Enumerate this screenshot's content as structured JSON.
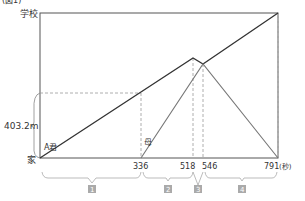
{
  "header_fragment": "(図1)",
  "y_axis": {
    "top_label": "学校",
    "bottom_label": "家",
    "distance_label": "403.2m"
  },
  "x_axis": {
    "ticks": [
      "336",
      "518",
      "546",
      "791"
    ],
    "unit": "(秒)"
  },
  "series_labels": {
    "a": "A君",
    "mother": "母"
  },
  "segments": [
    {
      "num": "1",
      "label": "1"
    },
    {
      "num": "2",
      "label": "2"
    },
    {
      "num": "3",
      "label": "3"
    },
    {
      "num": "4",
      "label": "4"
    }
  ],
  "colors": {
    "a_line": "#333333",
    "mother_line": "#777777",
    "frame": "#555555",
    "dashed": "#999999",
    "brace": "#aaaaaa",
    "box": "#aaaaaa"
  }
}
